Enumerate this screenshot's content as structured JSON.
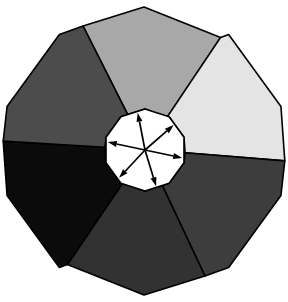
{
  "figure": {
    "type": "diagram",
    "canvas": {
      "width": 288,
      "height": 302,
      "background": "#ffffff"
    },
    "outline_color": "#000000",
    "outline_width": 1.6,
    "outer_polygon": {
      "name": "decagon",
      "sides": 10,
      "center": {
        "x": 144,
        "y": 151
      },
      "radius": 144,
      "rotation_deg": -90,
      "vertices": [
        {
          "x": 108,
          "y": 15
        },
        {
          "x": 180,
          "y": 15
        },
        {
          "x": 245,
          "y": 57
        },
        {
          "x": 273,
          "y": 113
        },
        {
          "x": 273,
          "y": 190
        },
        {
          "x": 240,
          "y": 250
        },
        {
          "x": 180,
          "y": 288
        },
        {
          "x": 107,
          "y": 288
        },
        {
          "x": 47,
          "y": 250
        },
        {
          "x": 13,
          "y": 187
        },
        {
          "x": 13,
          "y": 113
        },
        {
          "x": 47,
          "y": 55
        }
      ]
    },
    "inner_polygon": {
      "name": "hub",
      "sides": 10,
      "center": {
        "x": 145,
        "y": 150
      },
      "radius": 41,
      "rotation_deg": -90,
      "fill": "#ffffff"
    },
    "sector_count": 6,
    "sectors": [
      {
        "id": "sector-top",
        "label": "Top sector",
        "fill": "#a8a8a8",
        "start_deg": -116,
        "end_deg": -56,
        "shade": "light-medium-gray"
      },
      {
        "id": "sector-top-right",
        "label": "Top right sector",
        "fill": "#e4e4e4",
        "start_deg": -56,
        "end_deg": 4,
        "shade": "near-white"
      },
      {
        "id": "sector-right",
        "label": "Right sector",
        "fill": "#3d3d3d",
        "start_deg": 4,
        "end_deg": 64,
        "shade": "dark-gray"
      },
      {
        "id": "sector-bottom",
        "label": "Bottom sector",
        "fill": "#323232",
        "start_deg": 64,
        "end_deg": 124,
        "shade": "very-dark-gray"
      },
      {
        "id": "sector-bottom-left",
        "label": "Bottom left sector",
        "fill": "#0b0b0b",
        "start_deg": 124,
        "end_deg": 184,
        "shade": "black"
      },
      {
        "id": "sector-left",
        "label": "Left sector",
        "fill": "#4c4c4c",
        "start_deg": 184,
        "end_deg": 244,
        "shade": "medium-dark-gray"
      }
    ],
    "arrows": {
      "count": 6,
      "origin": {
        "x": 145,
        "y": 150
      },
      "color": "#000000",
      "stroke_width": 1.7,
      "head_length": 9,
      "head_width": 6,
      "items": [
        {
          "id": "arrow-up",
          "label": "Arrow up",
          "angle_deg": -101,
          "length": 38
        },
        {
          "id": "arrow-upper-right",
          "label": "Arrow upper right",
          "angle_deg": -41,
          "length": 38
        },
        {
          "id": "arrow-right",
          "label": "Arrow right",
          "angle_deg": 12,
          "length": 38
        },
        {
          "id": "arrow-lower-right",
          "label": "Arrow lower right",
          "angle_deg": 73,
          "length": 38
        },
        {
          "id": "arrow-lower-left",
          "label": "Arrow lower left",
          "angle_deg": 133,
          "length": 38
        },
        {
          "id": "arrow-left",
          "label": "Arrow left",
          "angle_deg": 192,
          "length": 38
        }
      ]
    }
  }
}
